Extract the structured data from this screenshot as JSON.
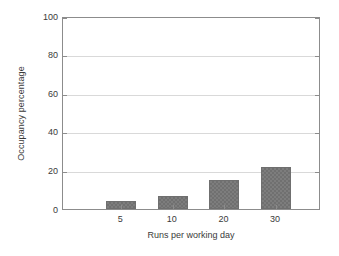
{
  "chart_data": {
    "type": "bar",
    "title": "",
    "xlabel": "Runs per working day",
    "ylabel": "Occupancy percentage",
    "categories": [
      "5",
      "10",
      "20",
      "30"
    ],
    "values": [
      4,
      7,
      15,
      22
    ],
    "ylim": [
      0,
      100
    ],
    "yticks": [
      0,
      20,
      40,
      60,
      80,
      100
    ],
    "ytick_labels": [
      "0",
      "20",
      "40",
      "60",
      "80",
      "100"
    ],
    "grid": "horizontal",
    "legend": "none",
    "series": [
      {
        "name": "Occupancy percentage",
        "values": [
          4,
          7,
          15,
          22
        ]
      }
    ],
    "colors": {
      "bar_fill": "#7d7d7d",
      "bar_edge": "#6f6f6f",
      "gridline": "#d9d9d9",
      "axis": "#8c8c8c",
      "text": "#3a3a3a",
      "background": "#ffffff"
    }
  }
}
